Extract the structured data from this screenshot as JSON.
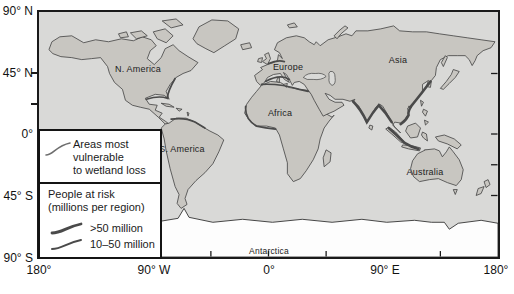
{
  "figure": {
    "kind": "world-map",
    "axes": {
      "latitude_labels": [
        "90° N",
        "45° N",
        "0°",
        "45° S",
        "90° S"
      ],
      "longitude_labels": [
        "180°",
        "90° W",
        "0°",
        "90° E",
        "180°"
      ]
    },
    "continent_labels": [
      "N. America",
      "Europe",
      "Asia",
      "Africa",
      "S. America",
      "Australia",
      "Antarctica"
    ],
    "legend": {
      "vulnerable_lines": [
        "Areas most",
        "vulnerable",
        "to wetland loss"
      ],
      "risk_title_lines": [
        "People at risk",
        "(millions per region)"
      ],
      "risk_items": [
        ">50 million",
        "10–50 million"
      ]
    },
    "colors": {
      "ocean": "#d9d9d7",
      "land": "#c8c6c1",
      "coastline": "#404040",
      "antarctica": "#fdfdfd",
      "vulnerable_line": "#6e6e6e",
      "risk_line": "#4a4a4a",
      "frame": "#1a1a1a",
      "text": "#111111"
    }
  }
}
